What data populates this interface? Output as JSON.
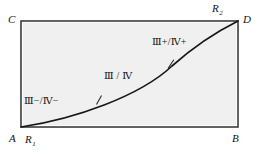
{
  "figure": {
    "type": "geometric-diagram",
    "background_color": "#ffffff",
    "rectangle": {
      "fill_color": "#f0f0f0",
      "stroke_color": "#3a3a3a",
      "stroke_width": 1.6,
      "x": 21,
      "y": 21,
      "width": 217,
      "height": 106,
      "corners": {
        "top_left": "C",
        "top_right": "D",
        "bottom_left": "A",
        "bottom_right": "B"
      }
    },
    "curve": {
      "stroke_color": "#171717",
      "stroke_width": 1.7,
      "shape": "concave-up",
      "start_point": "A",
      "end_point": "D",
      "path": "M 21 127 C 75 119, 140 96, 172 66 C 200 41, 224 28, 238 21",
      "tick_marks": [
        {
          "x": 99,
          "y": 100,
          "angle_deg": -26
        },
        {
          "x": 171,
          "y": 64,
          "angle_deg": -44
        }
      ]
    },
    "vertex_labels": [
      {
        "id": "C",
        "text": "C",
        "subscript": ""
      },
      {
        "id": "D",
        "text": "D",
        "subscript": ""
      },
      {
        "id": "A",
        "text": "A",
        "subscript": ""
      },
      {
        "id": "B",
        "text": "B",
        "subscript": ""
      },
      {
        "id": "R1",
        "text": "R",
        "subscript": "1"
      },
      {
        "id": "R2",
        "text": "R",
        "subscript": "2"
      }
    ],
    "region_labels": [
      {
        "id": "region-lower-left",
        "text": "Ⅲ−/Ⅳ−"
      },
      {
        "id": "region-middle",
        "text": "Ⅲ / Ⅳ"
      },
      {
        "id": "region-upper-right",
        "text": "Ⅲ+/Ⅳ+"
      }
    ]
  }
}
